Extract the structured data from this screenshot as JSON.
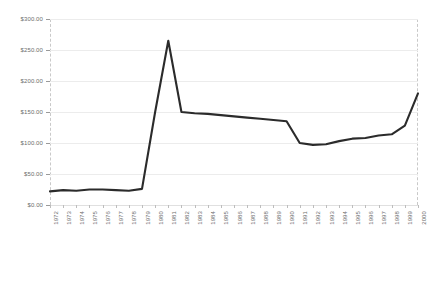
{
  "chart_data": {
    "type": "line",
    "title": "",
    "xlabel": "",
    "ylabel": "",
    "grid": true,
    "legend": false,
    "ylim": [
      0,
      300
    ],
    "ytick_values": [
      0,
      50,
      100,
      150,
      200,
      250,
      300
    ],
    "ytick_labels": [
      "$0.00",
      "$50.00",
      "$100.00",
      "$150.00",
      "$200.00",
      "$250.00",
      "$300.00"
    ],
    "categories": [
      "1972",
      "1973",
      "1974",
      "1975",
      "1976",
      "1977",
      "1978",
      "1979",
      "1980",
      "1981",
      "1982",
      "1983",
      "1984",
      "1985",
      "1986",
      "1987",
      "1988",
      "1989",
      "1990",
      "1991",
      "1992",
      "1993",
      "1994",
      "1995",
      "1996",
      "1997",
      "1998",
      "1999",
      "2000"
    ],
    "values": [
      22,
      24,
      23,
      25,
      25,
      24,
      23,
      26,
      150,
      265,
      150,
      148,
      147,
      145,
      143,
      141,
      139,
      137,
      135,
      100,
      97,
      98,
      103,
      107,
      108,
      112,
      114,
      128,
      180
    ],
    "series": [
      {
        "name": "value",
        "values": [
          22,
          24,
          23,
          25,
          25,
          24,
          23,
          26,
          150,
          265,
          150,
          148,
          147,
          145,
          143,
          141,
          139,
          137,
          135,
          100,
          97,
          98,
          103,
          107,
          108,
          112,
          114,
          128,
          180
        ]
      }
    ],
    "line_color": "#2b2b2b",
    "grid_color": "#ececec",
    "axis_color": "#c9c9c9",
    "tick_label_color": "#6d6d6d"
  }
}
